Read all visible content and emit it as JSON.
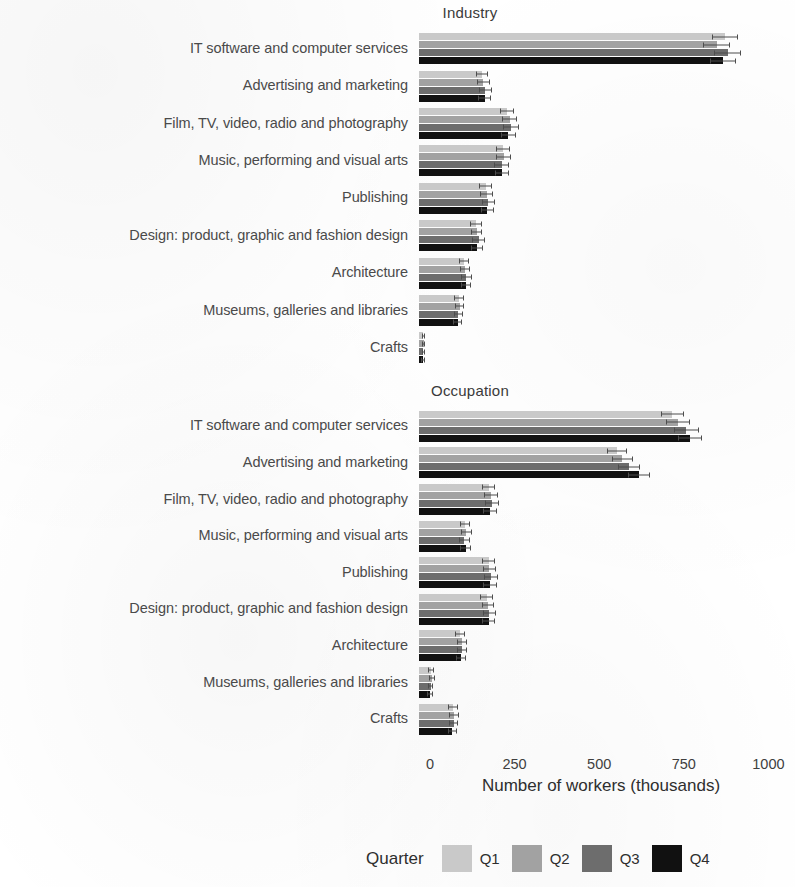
{
  "chart_data": {
    "type": "bar",
    "orientation": "horizontal",
    "grouped": true,
    "title": "",
    "xlabel": "Number of workers (thousands)",
    "ylabel": "",
    "xlim": [
      0,
      1000
    ],
    "xticks": [
      0,
      250,
      500,
      750,
      1000
    ],
    "xtick_labels": [
      "0",
      "250",
      "500",
      "750",
      "1000"
    ],
    "grid": false,
    "legend": {
      "title": "Quarter",
      "position": "bottom",
      "entries": [
        {
          "name": "Q1",
          "color": "#c9c9c9"
        },
        {
          "name": "Q2",
          "color": "#a2a2a2"
        },
        {
          "name": "Q3",
          "color": "#6d6d6d"
        },
        {
          "name": "Q4",
          "color": "#111111"
        }
      ]
    },
    "categories": [
      "IT software and computer services",
      "Advertising and marketing",
      "Film, TV, video, radio and photography",
      "Music, performing and visual arts",
      "Publishing",
      "Design: product, graphic and fashion design",
      "Architecture",
      "Museums, galleries and libraries",
      "Crafts"
    ],
    "panels": [
      {
        "title": "Industry",
        "series": [
          {
            "name": "Q1",
            "values": [
              905,
              186,
              260,
              248,
              197,
              168,
              132,
              118,
              13
            ],
            "errors": [
              38,
              18,
              22,
              21,
              19,
              17,
              15,
              14,
              5
            ]
          },
          {
            "name": "Q2",
            "values": [
              880,
              190,
              268,
              250,
              200,
              170,
              136,
              120,
              14
            ],
            "errors": [
              40,
              19,
              23,
              22,
              19,
              17,
              15,
              14,
              5
            ]
          },
          {
            "name": "Q3",
            "values": [
              912,
              196,
              272,
              244,
              205,
              176,
              140,
              116,
              13
            ],
            "errors": [
              41,
              19,
              23,
              21,
              20,
              18,
              16,
              14,
              5
            ]
          },
          {
            "name": "Q4",
            "values": [
              898,
              194,
              264,
              246,
              202,
              172,
              138,
              114,
              12
            ],
            "errors": [
              39,
              19,
              22,
              21,
              19,
              17,
              15,
              13,
              5
            ]
          }
        ]
      },
      {
        "title": "Occupation",
        "series": [
          {
            "name": "Q1",
            "values": [
              748,
              585,
              206,
              136,
              206,
              200,
              122,
              36,
              100
            ],
            "errors": [
              34,
              30,
              20,
              16,
              20,
              19,
              15,
              8,
              14
            ]
          },
          {
            "name": "Q2",
            "values": [
              766,
              600,
              212,
              140,
              208,
              204,
              126,
              38,
              104
            ],
            "errors": [
              35,
              31,
              20,
              16,
              20,
              19,
              15,
              8,
              14
            ]
          },
          {
            "name": "Q3",
            "values": [
              790,
              620,
              216,
              134,
              212,
              208,
              128,
              34,
              102
            ],
            "errors": [
              36,
              32,
              21,
              16,
              20,
              19,
              15,
              8,
              14
            ]
          },
          {
            "name": "Q4",
            "values": [
              800,
              650,
              210,
              138,
              210,
              206,
              124,
              32,
              98
            ],
            "errors": [
              36,
              33,
              20,
              16,
              20,
              19,
              15,
              8,
              13
            ]
          }
        ]
      }
    ]
  },
  "axis": {
    "title": "Number of workers (thousands)",
    "tick_0": "0",
    "tick_1": "250",
    "tick_2": "500",
    "tick_3": "750",
    "tick_4": "1000"
  },
  "panel_titles": {
    "industry": "Industry",
    "occupation": "Occupation"
  },
  "legend": {
    "title": "Quarter",
    "q1": "Q1",
    "q2": "Q2",
    "q3": "Q3",
    "q4": "Q4"
  }
}
